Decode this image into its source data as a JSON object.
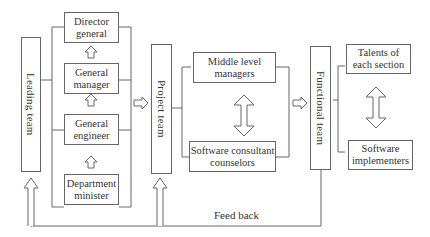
{
  "diagram": {
    "colors": {
      "stroke": "#666666",
      "text": "#333333",
      "background": "#ffffff"
    },
    "nodes": {
      "leading_team": "Leading team",
      "director_general": "Director general",
      "general_manager": "General manager",
      "general_engineer": "General engineer",
      "department_minister": "Department minister",
      "project_team": "Project team",
      "middle_level_managers": "Middle level managers",
      "software_consultant_counselors": "Software consultant counselors",
      "functional_team": "Functional team",
      "talents_of_each_section": "Talents of each section",
      "software_implementers": "Software implementers"
    },
    "labels": {
      "feedback": "Feed back"
    },
    "edges": [
      {
        "from": "department_minister",
        "to": "general_engineer",
        "type": "hollow-arrow-up"
      },
      {
        "from": "general_engineer",
        "to": "general_manager",
        "type": "hollow-arrow-up"
      },
      {
        "from": "general_manager",
        "to": "director_general",
        "type": "hollow-arrow-up"
      },
      {
        "from": "leadership_group",
        "to": "project_team",
        "type": "hollow-arrow-right"
      },
      {
        "from": "middle_level_managers",
        "to": "software_consultant_counselors",
        "type": "hollow-double-arrow"
      },
      {
        "from": "project_group",
        "to": "functional_team",
        "type": "hollow-arrow-right"
      },
      {
        "from": "talents_of_each_section",
        "to": "software_implementers",
        "type": "hollow-double-arrow"
      },
      {
        "from": "functional_team",
        "to": "leading_team",
        "type": "feedback-loop"
      },
      {
        "from": "functional_team",
        "to": "project_team",
        "type": "feedback-loop"
      }
    ]
  }
}
